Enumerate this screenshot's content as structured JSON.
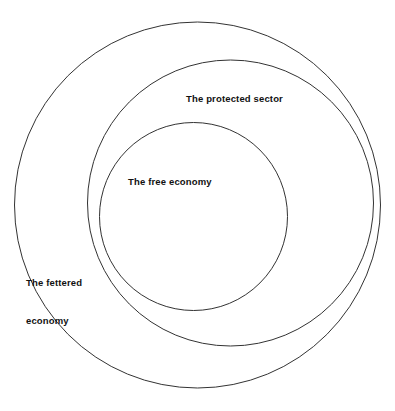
{
  "diagram": {
    "type": "euler-nested-circles",
    "background_color": "#ffffff",
    "stroke_color": "#333333",
    "stroke_width": 1,
    "text_color": "#111111",
    "canvas": {
      "width": 395,
      "height": 411
    },
    "circles": [
      {
        "id": "fettered-economy",
        "label": "The fettered economy",
        "cx": 197.5,
        "cy": 205,
        "r": 183,
        "level": 1,
        "fill": "none"
      },
      {
        "id": "protected-sector",
        "label": "The protected sector",
        "cx": 230.5,
        "cy": 203,
        "r": 143,
        "level": 2,
        "fill": "none"
      },
      {
        "id": "free-economy",
        "label": "The free economy",
        "cx": 193.5,
        "cy": 216.5,
        "r": 94,
        "level": 3,
        "fill": "none"
      }
    ],
    "labels": {
      "protected_sector": "The protected sector",
      "free_economy": "The free economy",
      "fettered_economy_line1": "The fettered",
      "fettered_economy_line2": "economy"
    }
  }
}
